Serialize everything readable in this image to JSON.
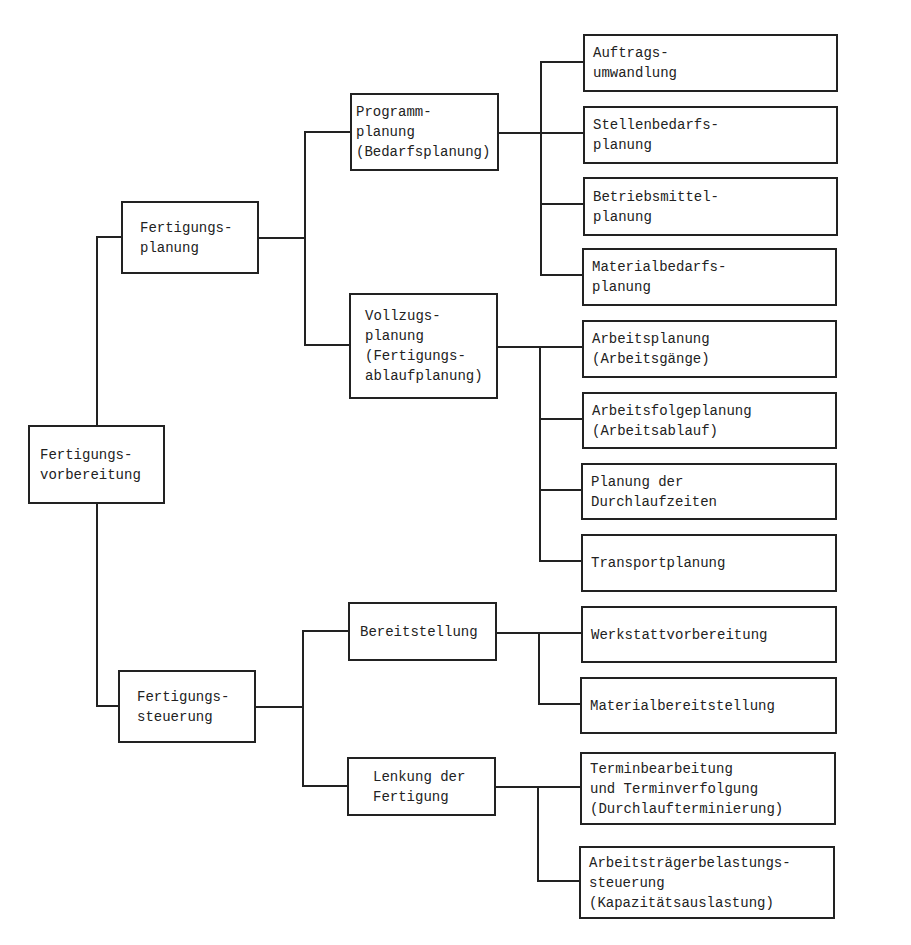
{
  "diagram": {
    "root": {
      "label": "Fertigungs-\nvorbereitung"
    },
    "level1": [
      {
        "label": "Fertigungs-\nplanung"
      },
      {
        "label": "Fertigungs-\nsteuerung"
      }
    ],
    "level2": [
      {
        "label": "Programm-\nplanung\n(Bedarfsplanung)"
      },
      {
        "label": "Vollzugs-\nplanung\n(Fertigungs-\nablaufplanung)"
      },
      {
        "label": "Bereitstellung"
      },
      {
        "label": "Lenkung der\nFertigung"
      }
    ],
    "level3": [
      {
        "label": "Auftrags-\numwandlung"
      },
      {
        "label": "Stellenbedarfs-\nplanung"
      },
      {
        "label": "Betriebsmittel-\nplanung"
      },
      {
        "label": "Materialbedarfs-\nplanung"
      },
      {
        "label": "Arbeitsplanung\n(Arbeitsgänge)"
      },
      {
        "label": "Arbeitsfolgeplanung\n(Arbeitsablauf)"
      },
      {
        "label": "Planung der\nDurchlaufzeiten"
      },
      {
        "label": "Transportplanung"
      },
      {
        "label": "Werkstattvorbereitung"
      },
      {
        "label": "Materialbereitstellung"
      },
      {
        "label": "Terminbearbeitung\nund Terminverfolgung\n(Durchlaufterminierung)"
      },
      {
        "label": "Arbeitsträgerbelastungs-\nsteuerung\n(Kapazitätsauslastung)"
      }
    ]
  },
  "colors": {
    "line": "#222222",
    "background": "#ffffff"
  }
}
